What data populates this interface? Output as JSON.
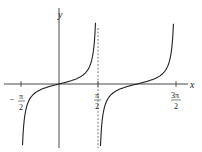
{
  "chart_data": {
    "type": "line",
    "title": "",
    "function": "y = tan(x)",
    "xlabel": "x",
    "ylabel": "y",
    "x_ticks": [
      {
        "value": -1.5708,
        "label_num": "π",
        "label_den": "2",
        "sign": "−"
      },
      {
        "value": 1.5708,
        "label_num": "π",
        "label_den": "2",
        "sign": ""
      },
      {
        "value": 4.7124,
        "label_num": "3π",
        "label_den": "2",
        "sign": ""
      }
    ],
    "xlim": [
      -1.75,
      5.2
    ],
    "ylim": [
      -10,
      10
    ],
    "asymptotes": [
      {
        "x": 1.5708,
        "style": "dashed"
      }
    ],
    "series": [
      {
        "name": "tan branch 1",
        "x_range": [
          -1.47,
          1.47
        ]
      },
      {
        "name": "tan branch 2",
        "x_range": [
          1.67,
          4.61
        ]
      }
    ],
    "grid": false,
    "legend": null,
    "colors": {
      "curve": "#222222",
      "axis": "#333333",
      "asymptote": "#555555"
    }
  },
  "labels": {
    "x_axis": "x",
    "y_axis": "y",
    "tick_neg_pi_2_sign": "−",
    "tick_pi": "π",
    "tick_3pi": "3π",
    "tick_den": "2"
  }
}
